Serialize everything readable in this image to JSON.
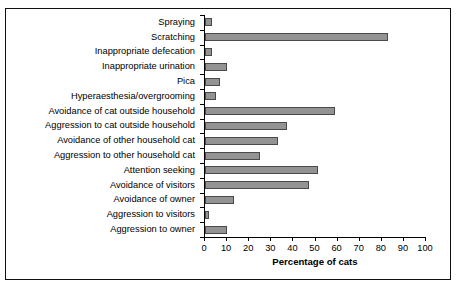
{
  "chart_data": {
    "type": "bar",
    "orientation": "horizontal",
    "title": "",
    "xlabel": "Percentage of cats",
    "ylabel": "",
    "xlim": [
      0,
      100
    ],
    "xticks": [
      0,
      10,
      20,
      30,
      40,
      50,
      60,
      70,
      80,
      90,
      100
    ],
    "grid": false,
    "legend": null,
    "bar_color": "#939393",
    "bar_edge_color": "#4a4a4a",
    "categories": [
      "Spraying",
      "Scratching",
      "Inappropriate defecation",
      "Inappropriate urination",
      "Pica",
      "Hyperaesthesia/overgrooming",
      "Avoidance of cat outside household",
      "Aggression to cat outside household",
      "Avoidance of other household cat",
      "Aggression to other household cat",
      "Attention seeking",
      "Avoidance of visitors",
      "Avoidance of owner",
      "Aggression to visitors",
      "Aggression to owner"
    ],
    "values": [
      3,
      83,
      3,
      10,
      7,
      5,
      59,
      37,
      33,
      25,
      51,
      47,
      13,
      2,
      10
    ]
  }
}
